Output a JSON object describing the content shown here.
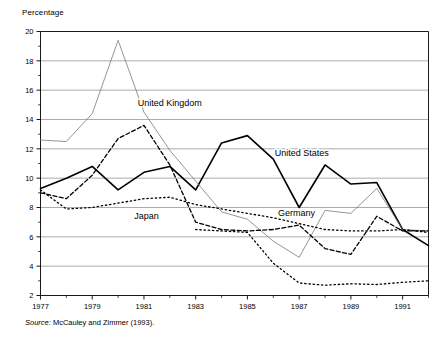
{
  "figure": {
    "axis_title": "Percentage",
    "source_prefix": "Source:",
    "source_text": " McCauley and Zimmer (1993)."
  },
  "chart_data": {
    "type": "line",
    "title": "",
    "subtitle": "",
    "xlabel": "",
    "ylabel": "Percentage",
    "xlim": [
      1977,
      1992
    ],
    "ylim": [
      2,
      20
    ],
    "yticks": [
      2,
      4,
      6,
      8,
      10,
      12,
      14,
      16,
      18,
      20
    ],
    "ytick_labels": [
      "2",
      "4",
      "6",
      "8",
      "10",
      "12",
      "14",
      "16",
      "18",
      "20"
    ],
    "yminor_ticks": [
      3,
      5,
      7,
      9,
      11,
      13,
      15,
      17,
      19
    ],
    "xticks": [
      1977,
      1979,
      1981,
      1983,
      1985,
      1987,
      1989,
      1991
    ],
    "xtick_labels": [
      "1977",
      "1979",
      "1981",
      "1983",
      "1985",
      "1987",
      "1989",
      "1991"
    ],
    "xminor_ticks": [
      1978,
      1980,
      1982,
      1984,
      1986,
      1988,
      1990,
      1992
    ],
    "grid": "horizontal",
    "legend_position": "inline-annotations",
    "x": [
      1977,
      1978,
      1979,
      1980,
      1981,
      1982,
      1983,
      1984,
      1985,
      1986,
      1987,
      1988,
      1989,
      1990,
      1991,
      1992
    ],
    "series": [
      {
        "name": "United States",
        "style": "solid",
        "color": "#000000",
        "width": 1.6,
        "label_x": 1987.1,
        "label_y": 11.5,
        "values": [
          9.3,
          10.0,
          10.8,
          9.2,
          10.4,
          10.8,
          9.2,
          12.4,
          12.9,
          11.3,
          8.0,
          10.9,
          9.6,
          9.7,
          6.5,
          5.4
        ]
      },
      {
        "name": "United Kingdom",
        "style": "thin-solid",
        "color": "#7a7a7a",
        "width": 0.8,
        "label_x": 1982.0,
        "label_y": 14.9,
        "values": [
          12.6,
          12.5,
          14.4,
          19.4,
          14.5,
          11.9,
          9.8,
          7.7,
          7.2,
          5.7,
          4.6,
          7.8,
          7.6,
          9.3,
          6.5,
          6.4
        ]
      },
      {
        "name": "Germany",
        "style": "dashed",
        "color": "#000000",
        "width": 1.3,
        "label_x": 1986.9,
        "label_y": 7.4,
        "values": [
          9.0,
          8.6,
          10.2,
          12.7,
          13.6,
          10.9,
          7.0,
          6.5,
          6.4,
          6.5,
          6.8,
          5.2,
          4.8,
          7.4,
          6.4,
          6.4
        ]
      },
      {
        "name": "Japan",
        "style": "dotted",
        "color": "#000000",
        "width": 1.3,
        "label_x": 1981.1,
        "label_y": 7.2,
        "values": [
          9.2,
          7.9,
          8.0,
          8.3,
          8.6,
          8.7,
          8.2,
          7.9,
          7.6,
          7.3,
          6.9,
          6.5,
          6.4,
          6.4,
          6.5,
          6.3
        ]
      }
    ],
    "japan_lower_segment": {
      "name": "Japan",
      "note": "continuation of dotted Japan series at low values",
      "x": [
        1983,
        1984,
        1985,
        1986,
        1987,
        1988,
        1989,
        1990,
        1991,
        1992
      ],
      "values": [
        6.5,
        6.4,
        6.3,
        4.2,
        2.85,
        2.7,
        2.8,
        2.75,
        2.9,
        3.0
      ]
    }
  }
}
